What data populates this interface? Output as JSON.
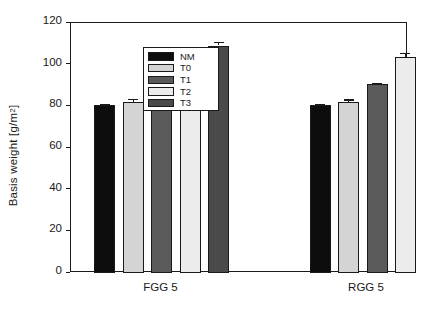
{
  "chart_data": {
    "type": "bar",
    "title": "",
    "xlabel": "",
    "ylabel": "Basis weight [g/m2]",
    "ylabel_base": "Basis weight [g/m",
    "ylabel_sup": "2",
    "ylabel_tail": "]",
    "ylim": [
      0,
      120
    ],
    "yticks": [
      0,
      20,
      40,
      60,
      80,
      100,
      120
    ],
    "ytick_labels": [
      "0",
      "20",
      "40",
      "60",
      "80",
      "100",
      "120"
    ],
    "grid": false,
    "legend_position": "top-left inside axes",
    "categories": [
      "FGG 5",
      "RGG 5"
    ],
    "series": [
      {
        "name": "NM",
        "color": "#0d0d0d",
        "values": [
          80.5,
          80.5
        ],
        "errors": [
          0.7,
          0.8
        ]
      },
      {
        "name": "T0",
        "color": "#d4d4d4",
        "values": [
          82.0,
          82.0
        ],
        "errors": [
          1.6,
          1.3
        ]
      },
      {
        "name": "T1",
        "color": "#5a5a5a",
        "values": [
          84.2,
          90.5
        ],
        "errors": [
          1.5,
          0.8
        ]
      },
      {
        "name": "T2",
        "color": "#ececec",
        "values": [
          96.3,
          103.5
        ],
        "errors": [
          0.7,
          2.3
        ]
      },
      {
        "name": "T3",
        "color": "#4a4a4a",
        "values": [
          109.2,
          null
        ],
        "errors": [
          1.7,
          null
        ]
      }
    ]
  },
  "legend": {
    "entries": [
      {
        "label": "NM",
        "color": "#0d0d0d"
      },
      {
        "label": "T0",
        "color": "#d4d4d4"
      },
      {
        "label": "T1",
        "color": "#5a5a5a"
      },
      {
        "label": "T2",
        "color": "#ececec"
      },
      {
        "label": "T3",
        "color": "#4a4a4a"
      }
    ]
  },
  "axis": {
    "frame_color": "#1a1a1a"
  }
}
